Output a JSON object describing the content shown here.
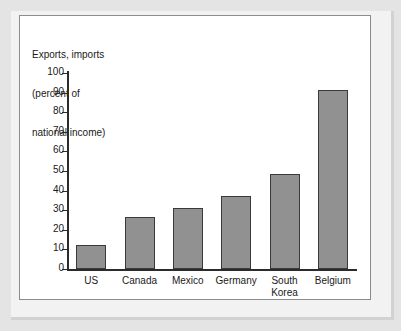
{
  "chart_data": {
    "type": "bar",
    "title": "Exports, imports (percent of national income)",
    "title_lines": [
      "Exports, imports",
      "(percent of",
      "national income)"
    ],
    "xlabel": "",
    "ylabel": "",
    "categories": [
      "US",
      "Canada",
      "Mexico",
      "Germany",
      "South\nKorea",
      "Belgium"
    ],
    "category_labels": [
      "US",
      "Canada",
      "Mexico",
      "Germany",
      "South Korea",
      "Belgium"
    ],
    "values": [
      12,
      26.5,
      31,
      37.5,
      48.5,
      91.5
    ],
    "ylim": [
      0,
      100
    ],
    "ytick_labels": [
      "100",
      "90",
      "80",
      "70",
      "60",
      "50",
      "40",
      "30",
      "20",
      "10",
      "0"
    ],
    "yticks": [
      100,
      90,
      80,
      70,
      60,
      50,
      40,
      30,
      20,
      10,
      0
    ],
    "grid": false,
    "legend": false,
    "colors": {
      "bar_fill": "#919191",
      "bar_border": "#3a3a3a",
      "axis": "#2b2b2b",
      "panel_background": "#ffffff",
      "panel_border": "#8c8c8c",
      "page_background": "#e4e4e4",
      "text": "#1a1a1a"
    }
  }
}
